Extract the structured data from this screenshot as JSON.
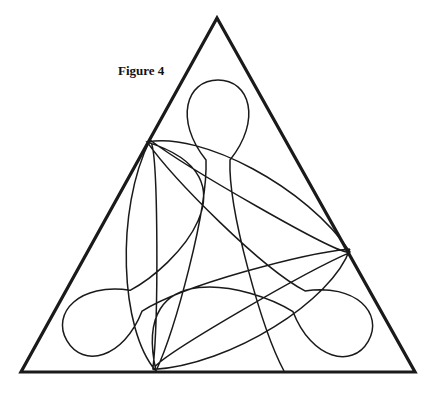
{
  "figure": {
    "caption": "Figure 4",
    "stroke_color": "#1a1a1a",
    "background": "#ffffff"
  }
}
